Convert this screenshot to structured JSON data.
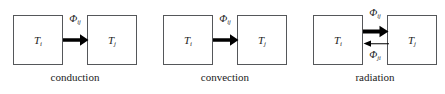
{
  "figure": {
    "diagrams": [
      {
        "id": "conduction",
        "caption": "conduction",
        "left_box": {
          "symbol": "T",
          "subscript": "i"
        },
        "right_box": {
          "symbol": "T",
          "subscript": "j"
        },
        "arrows": [
          {
            "direction": "right",
            "weight": "thick",
            "label_symbol": "Φ",
            "label_subscript": "ij",
            "label_position": "above"
          }
        ]
      },
      {
        "id": "convection",
        "caption": "convection",
        "left_box": {
          "symbol": "T",
          "subscript": "i"
        },
        "right_box": {
          "symbol": "T",
          "subscript": "j"
        },
        "arrows": [
          {
            "direction": "right",
            "weight": "thick",
            "label_symbol": "Φ",
            "label_subscript": "ij",
            "label_position": "above"
          }
        ]
      },
      {
        "id": "radiation",
        "caption": "radiation",
        "left_box": {
          "symbol": "T",
          "subscript": "i"
        },
        "right_box": {
          "symbol": "T",
          "subscript": "j"
        },
        "arrows": [
          {
            "direction": "right",
            "weight": "thick",
            "label_symbol": "Φ",
            "label_subscript": "ij",
            "label_position": "above"
          },
          {
            "direction": "left",
            "weight": "thin",
            "label_symbol": "Φ",
            "label_subscript": "ji",
            "label_position": "below"
          }
        ]
      }
    ]
  },
  "colors": {
    "box_border": "#55575a",
    "arrow": "#000000",
    "text": "#1b1b1b",
    "background": "#ffffff"
  }
}
